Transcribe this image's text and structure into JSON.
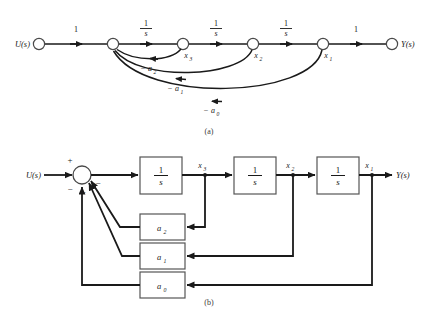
{
  "figure": {
    "title_hidden": "",
    "captions": {
      "a": "(a)",
      "b": "(b)"
    }
  },
  "signal_flow_graph": {
    "name": "signal-flow-graph",
    "input_label": "U(s)",
    "output_label": "Y(s)",
    "node_labels": [
      "",
      "",
      "x",
      "x",
      "x",
      ""
    ],
    "state_labels": {
      "x3": "x",
      "x3_sub": "3",
      "x2": "x",
      "x2_sub": "2",
      "x1": "x",
      "x1_sub": "1"
    },
    "forward_gains": [
      {
        "label": "1",
        "type": "plain"
      },
      {
        "numerator": "1",
        "denominator": "s",
        "type": "fraction"
      },
      {
        "numerator": "1",
        "denominator": "s",
        "type": "fraction"
      },
      {
        "numerator": "1",
        "denominator": "s",
        "type": "fraction"
      },
      {
        "label": "1",
        "type": "plain"
      }
    ],
    "feedback_gains": [
      {
        "sign": "−",
        "symbol": "a",
        "subscript": "2"
      },
      {
        "sign": "−",
        "symbol": "a",
        "subscript": "1"
      },
      {
        "sign": "−",
        "symbol": "a",
        "subscript": "0"
      }
    ]
  },
  "block_diagram": {
    "name": "block-diagram",
    "input_label": "U(s)",
    "output_label": "Y(s)",
    "summer": {
      "plus_sign": "+",
      "minus_signs": [
        "−",
        "−",
        "−"
      ]
    },
    "integrator_blocks": [
      {
        "numerator": "1",
        "denominator": "s"
      },
      {
        "numerator": "1",
        "denominator": "s"
      },
      {
        "numerator": "1",
        "denominator": "s"
      }
    ],
    "state_labels": [
      {
        "symbol": "x",
        "subscript": "3"
      },
      {
        "symbol": "x",
        "subscript": "2"
      },
      {
        "symbol": "x",
        "subscript": "1"
      }
    ],
    "feedback_blocks": [
      {
        "symbol": "a",
        "subscript": "2"
      },
      {
        "symbol": "a",
        "subscript": "1"
      },
      {
        "symbol": "a",
        "subscript": "0"
      }
    ]
  },
  "colors": {
    "ink": "#1a1a1a",
    "box_stroke": "#555555",
    "node_stroke": "#4a4a4a",
    "background": "#ffffff"
  }
}
